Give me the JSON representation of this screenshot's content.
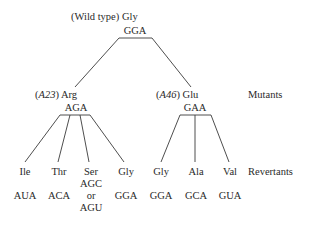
{
  "root": {
    "prefix": "(Wild type)",
    "amino_acid": "Gly",
    "codon": "GGA"
  },
  "mutants": [
    {
      "strain": "A23",
      "amino_acid": "Arg",
      "codon": "AGA"
    },
    {
      "strain": "A46",
      "amino_acid": "Glu",
      "codon": "GAA"
    }
  ],
  "row_labels": {
    "mutants": "Mutants",
    "revertants": "Revertants"
  },
  "revertants": [
    {
      "amino_acid": "Ile",
      "codon": "AUA"
    },
    {
      "amino_acid": "Thr",
      "codon": "ACA"
    },
    {
      "amino_acid": "Ser",
      "codon_a": "AGC",
      "or": "or",
      "codon_b": "AGU"
    },
    {
      "amino_acid": "Gly",
      "codon": "GGA"
    },
    {
      "amino_acid": "Gly",
      "codon": "GGA"
    },
    {
      "amino_acid": "Ala",
      "codon": "GCA"
    },
    {
      "amino_acid": "Val",
      "codon": "GUA"
    }
  ]
}
